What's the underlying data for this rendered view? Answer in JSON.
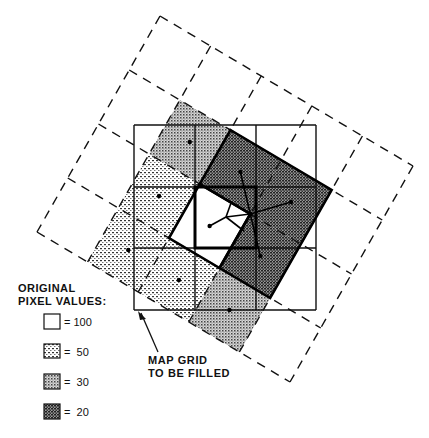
{
  "diagram": {
    "rotated_grid": {
      "columns": 5,
      "rows": 4,
      "shaded_cells": [
        {
          "col": 1,
          "row": 1,
          "value": 30
        },
        {
          "col": 2,
          "row": 1,
          "value": 20
        },
        {
          "col": 3,
          "row": 1,
          "value": 20
        },
        {
          "col": 1,
          "row": 2,
          "value": 50
        },
        {
          "col": 2,
          "row": 2,
          "value": 100
        },
        {
          "col": 3,
          "row": 2,
          "value": 20
        },
        {
          "col": 1,
          "row": 3,
          "value": 50
        },
        {
          "col": 2,
          "row": 3,
          "value": 50
        },
        {
          "col": 3,
          "row": 3,
          "value": 30
        }
      ]
    },
    "map_grid": {
      "columns": 3,
      "rows": 3,
      "target_cell": {
        "col": 1,
        "row": 1
      }
    },
    "callout": {
      "line1": "MAP GRID",
      "line2": "TO BE FILLED"
    },
    "legend": {
      "title_line1": "ORIGINAL",
      "title_line2": "PIXEL VALUES:",
      "items": [
        {
          "value": 100,
          "label": "= 100",
          "pattern": "white"
        },
        {
          "value": 50,
          "label": "=  50",
          "pattern": "light-dots"
        },
        {
          "value": 30,
          "label": "=  30",
          "pattern": "medium-dots"
        },
        {
          "value": 20,
          "label": "=  20",
          "pattern": "dark-dots"
        }
      ]
    }
  }
}
